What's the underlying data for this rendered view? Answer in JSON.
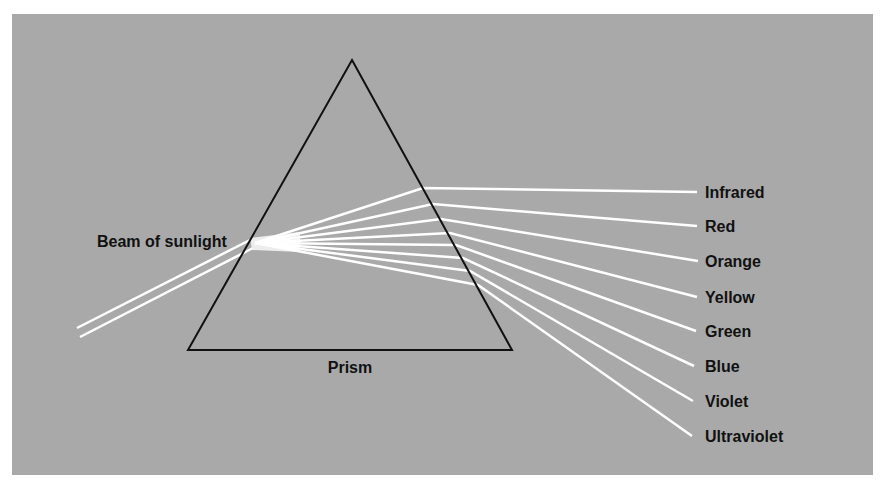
{
  "figure": {
    "title_labels": {
      "source": "Beam of sunlight",
      "prism": "Prism"
    },
    "spectrum": [
      {
        "name": "Infrared"
      },
      {
        "name": "Red"
      },
      {
        "name": "Orange"
      },
      {
        "name": "Yellow"
      },
      {
        "name": "Green"
      },
      {
        "name": "Blue"
      },
      {
        "name": "Violet"
      },
      {
        "name": "Ultraviolet"
      }
    ],
    "colors": {
      "background": "#a9a9a9",
      "rays": "#ffffff",
      "prism_outline": "#111111",
      "text": "#111111"
    }
  }
}
